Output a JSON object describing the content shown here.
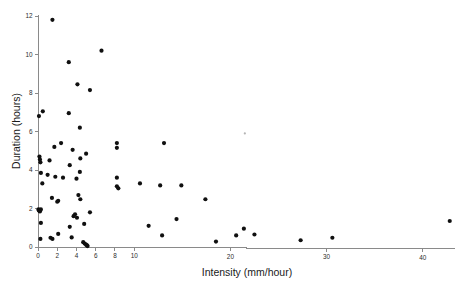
{
  "chart_data": {
    "type": "scatter",
    "title": "",
    "xlabel": "Intensity (mm/hour)",
    "ylabel": "Duration (hours)",
    "xlim": [
      0,
      44.5
    ],
    "ylim": [
      0,
      12.2
    ],
    "xticks": [
      0,
      2,
      4,
      6,
      8,
      10,
      20,
      30,
      40
    ],
    "yticks": [
      0,
      2,
      4,
      6,
      8,
      10,
      12
    ],
    "xtick_labels": [
      "0",
      "2",
      "4",
      "6",
      "8",
      "10",
      "20",
      "30",
      "40"
    ],
    "ytick_labels": [
      "0",
      "2",
      "4",
      "6",
      "8",
      "10",
      "12"
    ],
    "grid": false,
    "legend": null,
    "marker": "filled-circle",
    "marker_color": "#101010",
    "axis_color": "#8a8a8a",
    "background": "#ffffff",
    "n_points": 83,
    "points": [
      [
        0.1,
        6.8
      ],
      [
        0.5,
        7.05
      ],
      [
        1.5,
        11.8
      ],
      [
        3.2,
        9.6
      ],
      [
        6.6,
        10.2
      ],
      [
        4.1,
        8.45
      ],
      [
        5.4,
        8.15
      ],
      [
        3.2,
        6.95
      ],
      [
        4.35,
        6.2
      ],
      [
        21.5,
        5.9
      ],
      [
        1.7,
        5.2
      ],
      [
        2.4,
        5.4
      ],
      [
        3.6,
        5.05
      ],
      [
        5.0,
        4.85
      ],
      [
        8.2,
        5.4
      ],
      [
        8.2,
        5.15
      ],
      [
        13.1,
        5.4
      ],
      [
        0.15,
        4.7
      ],
      [
        0.2,
        4.55
      ],
      [
        0.25,
        4.4
      ],
      [
        1.2,
        4.5
      ],
      [
        3.3,
        4.25
      ],
      [
        4.4,
        4.6
      ],
      [
        0.3,
        3.85
      ],
      [
        0.45,
        3.3
      ],
      [
        1.0,
        3.75
      ],
      [
        1.8,
        3.65
      ],
      [
        2.6,
        3.6
      ],
      [
        4.0,
        3.55
      ],
      [
        4.35,
        3.9
      ],
      [
        8.2,
        3.6
      ],
      [
        8.2,
        3.15
      ],
      [
        8.35,
        3.05
      ],
      [
        10.6,
        3.3
      ],
      [
        12.7,
        3.2
      ],
      [
        14.9,
        3.2
      ],
      [
        17.4,
        2.48
      ],
      [
        1.45,
        2.55
      ],
      [
        2.0,
        2.35
      ],
      [
        2.1,
        2.4
      ],
      [
        4.2,
        2.7
      ],
      [
        4.4,
        2.48
      ],
      [
        0.05,
        1.95
      ],
      [
        0.1,
        1.9
      ],
      [
        0.15,
        1.88
      ],
      [
        0.2,
        1.85
      ],
      [
        0.3,
        1.95
      ],
      [
        3.7,
        1.6
      ],
      [
        3.85,
        1.7
      ],
      [
        4.05,
        1.52
      ],
      [
        5.4,
        1.8
      ],
      [
        14.4,
        1.45
      ],
      [
        42.8,
        1.35
      ],
      [
        0.3,
        1.25
      ],
      [
        3.3,
        1.05
      ],
      [
        4.8,
        1.2
      ],
      [
        11.5,
        1.1
      ],
      [
        21.4,
        0.95
      ],
      [
        0.25,
        0.42
      ],
      [
        1.3,
        0.48
      ],
      [
        1.5,
        0.42
      ],
      [
        2.1,
        0.68
      ],
      [
        3.5,
        0.5
      ],
      [
        12.9,
        0.6
      ],
      [
        20.6,
        0.6
      ],
      [
        22.5,
        0.65
      ],
      [
        27.3,
        0.35
      ],
      [
        30.6,
        0.48
      ],
      [
        18.5,
        0.28
      ],
      [
        4.7,
        0.25
      ],
      [
        4.85,
        0.18
      ],
      [
        5.0,
        0.12
      ],
      [
        5.1,
        0.08
      ],
      [
        5.15,
        0.05
      ]
    ]
  },
  "axes": {
    "x_title": "Intensity (mm/hour)",
    "y_title": "Duration (hours)"
  }
}
